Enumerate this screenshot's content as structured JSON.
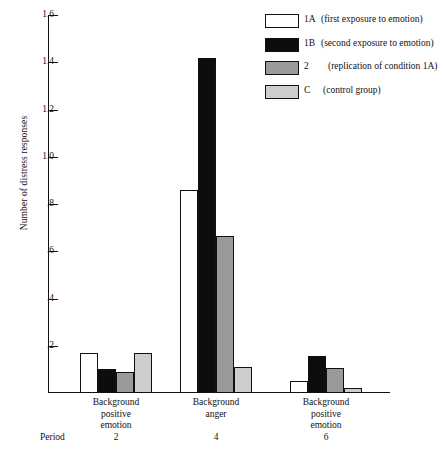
{
  "chart_data": {
    "type": "bar",
    "title": "",
    "xlabel": "",
    "ylabel": "Number of distress responses",
    "ylim": [
      0,
      1.6
    ],
    "ytick_labels": [
      "1.6",
      "1.4",
      "1.2",
      "1.0",
      ".8",
      ".6",
      ".4",
      ".2"
    ],
    "ytick_values": [
      1.6,
      1.4,
      1.2,
      1.0,
      0.8,
      0.6,
      0.4,
      0.2
    ],
    "grid": false,
    "legend_position": "top-right",
    "categories": [
      "Background positive emotion",
      "Background anger",
      "Background positive emotion"
    ],
    "category_lines": [
      [
        "Background",
        "positive",
        "emotion"
      ],
      [
        "Background",
        "anger"
      ],
      [
        "Background",
        "positive",
        "emotion"
      ]
    ],
    "period_label": "Period",
    "periods": [
      "2",
      "4",
      "6"
    ],
    "series": [
      {
        "name": "1A",
        "description": "(first exposure to emotion)",
        "color": "#ffffff",
        "values": [
          0.17,
          0.86,
          0.05
        ]
      },
      {
        "name": "1B",
        "description": "(second exposure to emotion)",
        "color": "#0d0d0d",
        "values": [
          0.1,
          1.42,
          0.155
        ]
      },
      {
        "name": "2",
        "description": "(replication of condition 1A)",
        "color": "#9a9a9a",
        "values": [
          0.09,
          0.665,
          0.105
        ]
      },
      {
        "name": "C",
        "description": "(control group)",
        "color": "#cdcdcd",
        "values": [
          0.17,
          0.11,
          0.02
        ]
      }
    ]
  },
  "legend": {
    "items": [
      {
        "key": "1A",
        "desc": "(first exposure to emotion)",
        "color": "#ffffff"
      },
      {
        "key": "1B",
        "desc": "(second exposure to emotion)",
        "color": "#0d0d0d"
      },
      {
        "key": "2",
        "desc": "(replication of condition 1A)",
        "color": "#9a9a9a"
      },
      {
        "key": "C",
        "desc": "(control group)",
        "color": "#cdcdcd"
      }
    ]
  }
}
